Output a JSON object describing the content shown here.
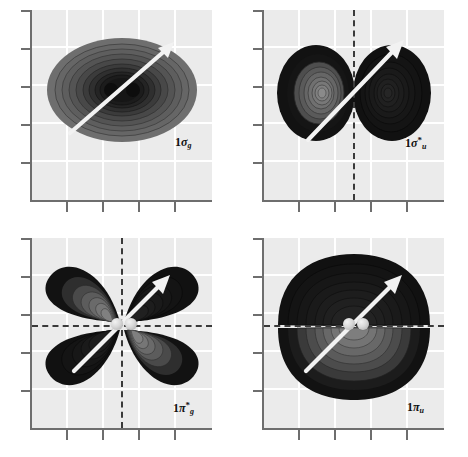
{
  "figure": {
    "kind": "molecular-orbital-contour-grid",
    "rows": 2,
    "columns": 2,
    "background_color": "#ffffff",
    "plot_background_color": "#ebebeb",
    "gridline_color": "#ffffff",
    "axis_color": "#6e6e6e",
    "nodal_plane_color": "#3a3a3a",
    "arrow_color": "#f0f0f0",
    "contour_dark_color": "#121212",
    "contour_mid_color": "#6b6b6b",
    "nucleus_color": "#d8d8d8"
  },
  "panels": [
    {
      "id": "panel-sigma-g",
      "label_prefix": "1",
      "label_symbol": "σ",
      "label_star": "",
      "label_sub": "g",
      "label_full": "1σg",
      "orbital_type": "sigma bonding",
      "nodal_planes": [],
      "shape": "single-ellipse",
      "x_ticks": 4,
      "y_ticks": 5,
      "grid_columns": 4,
      "grid_rows": 4,
      "nuclei_visible": false,
      "arrow": "internuclear-axis"
    },
    {
      "id": "panel-sigma-u-star",
      "label_prefix": "1",
      "label_symbol": "σ",
      "label_star": "*",
      "label_sub": "u",
      "label_full": "1σ*u",
      "orbital_type": "sigma antibonding",
      "nodal_planes": [
        "vertical"
      ],
      "shape": "two-lobes-left-right",
      "x_ticks": 4,
      "y_ticks": 5,
      "grid_columns": 4,
      "grid_rows": 4,
      "nuclei_visible": false,
      "arrow": "internuclear-axis"
    },
    {
      "id": "panel-pi-g-star",
      "label_prefix": "1",
      "label_symbol": "π",
      "label_star": "*",
      "label_sub": "g",
      "label_full": "1π*g",
      "orbital_type": "pi antibonding",
      "nodal_planes": [
        "vertical",
        "horizontal"
      ],
      "shape": "four-lobes",
      "x_ticks": 4,
      "y_ticks": 5,
      "grid_columns": 4,
      "grid_rows": 4,
      "nuclei_visible": true,
      "nuclei_count": 2,
      "arrow": "internuclear-axis"
    },
    {
      "id": "panel-pi-u",
      "label_prefix": "1",
      "label_symbol": "π",
      "label_star": "",
      "label_sub": "u",
      "label_full": "1πu",
      "orbital_type": "pi bonding",
      "nodal_planes": [
        "horizontal"
      ],
      "shape": "two-lobes-top-bottom",
      "x_ticks": 4,
      "y_ticks": 5,
      "grid_columns": 4,
      "grid_rows": 4,
      "nuclei_visible": true,
      "nuclei_count": 2,
      "arrow": "internuclear-axis"
    }
  ]
}
